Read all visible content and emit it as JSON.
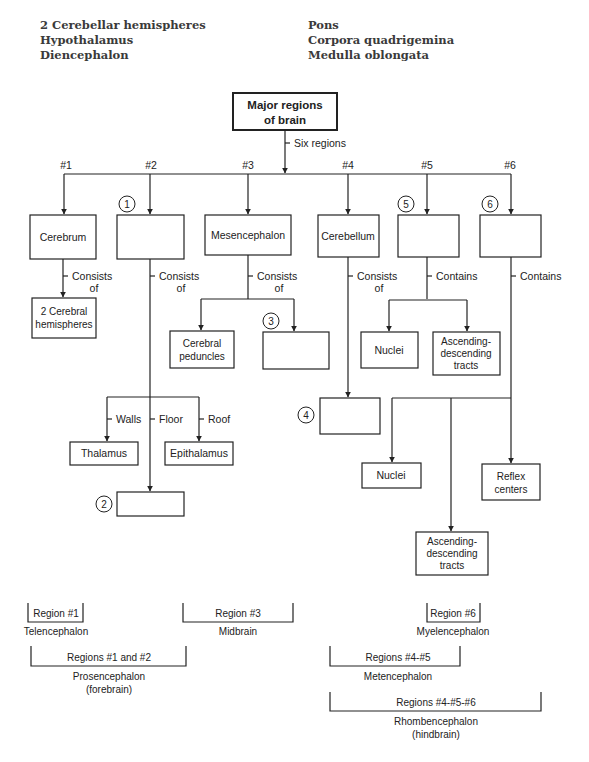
{
  "word_bank": {
    "left": [
      "2 Cerebellar hemispheres",
      "Hypothalamus",
      "Diencephalon"
    ],
    "right": [
      "Pons",
      "Corpora quadrigemina",
      "Medulla oblongata"
    ]
  },
  "diagram": {
    "root": {
      "line1": "Major regions",
      "line2": "of brain"
    },
    "root_edge_label": "Six regions",
    "region_numbers": [
      "#1",
      "#2",
      "#3",
      "#4",
      "#5",
      "#6"
    ],
    "regions": [
      {
        "label": "Cerebrum",
        "blank_marker": ""
      },
      {
        "label": "",
        "blank_marker": "1"
      },
      {
        "label": "Mesencephalon",
        "blank_marker": ""
      },
      {
        "label": "Cerebellum",
        "blank_marker": ""
      },
      {
        "label": "",
        "blank_marker": "5"
      },
      {
        "label": "",
        "blank_marker": "6"
      }
    ],
    "edge_labels": {
      "consists": "Consists",
      "of": "of",
      "contains": "Contains",
      "walls": "Walls",
      "floor": "Floor",
      "roof": "Roof"
    },
    "children": {
      "cerebrum": {
        "line1": "2 Cerebral",
        "line2": "hemispheres"
      },
      "mesencephalon_1": {
        "line1": "Cerebral",
        "line2": "peduncles"
      },
      "mesencephalon_2_marker": "3",
      "region5_1": "Nuclei",
      "region5_2": {
        "line1": "Ascending-",
        "line2": "descending",
        "line3": "tracts"
      },
      "region2_walls": "Thalamus",
      "region2_roof": "Epithalamus",
      "region2_floor_marker": "2",
      "cerebellum_marker": "4",
      "region6_1": "Nuclei",
      "region6_2": {
        "line1": "Reflex",
        "line2": "centers"
      },
      "region6_3": {
        "line1": "Ascending-",
        "line2": "descending",
        "line3": "tracts"
      }
    }
  },
  "groupings": {
    "region1": {
      "label": "Region #1",
      "name": "Telencephalon"
    },
    "region3": {
      "label": "Region #3",
      "name": "Midbrain"
    },
    "region6": {
      "label": "Region #6",
      "name": "Myelencephalon"
    },
    "regions12": {
      "label": "Regions #1 and #2",
      "name1": "Prosencephalon",
      "name2": "(forebrain)"
    },
    "regions45": {
      "label": "Regions #4-#5",
      "name": "Metencephalon"
    },
    "regions456": {
      "label": "Regions #4-#5-#6",
      "name1": "Rhombencephalon",
      "name2": "(hindbrain)"
    }
  }
}
